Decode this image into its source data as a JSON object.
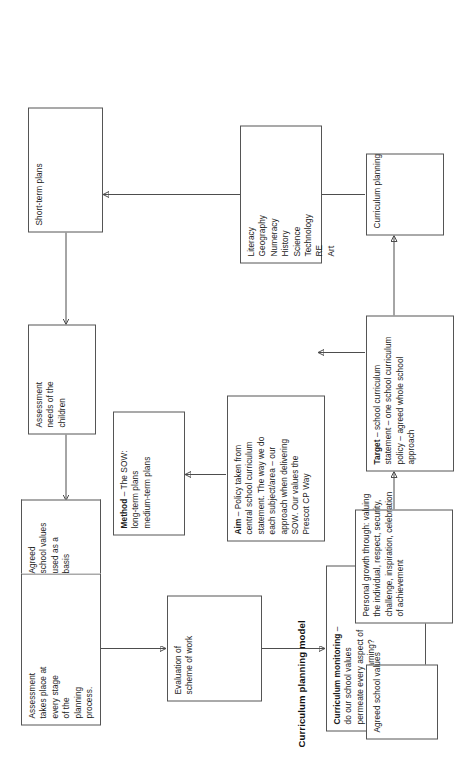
{
  "diagram": {
    "title": "Curriculum planning model",
    "type": "flowchart",
    "orientation": "rotated-90-ccw",
    "colors": {
      "background": "#ffffff",
      "box_border": "#555555",
      "text": "#1a1a1a",
      "connector": "#4d4d4d"
    },
    "nodes": [
      {
        "id": "assessment-stage",
        "lines": [
          "Assessment",
          "takes place at",
          "every stage",
          "of the",
          "planning",
          "process.",
          "Agreed",
          "school values",
          "used as a",
          "basis"
        ]
      },
      {
        "id": "assessment-needs",
        "lines": [
          "Assessment",
          "needs of the",
          "children"
        ]
      },
      {
        "id": "short-term-plans",
        "lines": [
          "Short-term plans"
        ]
      },
      {
        "id": "evaluation-scheme",
        "lines": [
          "Evaluation of",
          "scheme of work"
        ]
      },
      {
        "id": "method-sow",
        "lines": [
          "Method – The SOW:",
          "long-term plans",
          "medium-term plans"
        ],
        "bold_lead": "Method"
      },
      {
        "id": "curriculum-monitoring",
        "lines": [
          "Curriculum monitoring –",
          "do our school values",
          "permeate every aspect of",
          "teaching and learning?"
        ],
        "bold_lead": "Curriculum monitoring"
      },
      {
        "id": "aim-policy",
        "lines": [
          "Aim – Policy taken from",
          "central school curriculum",
          "statement. The way we do",
          "each subject/area – our",
          "approach when delivering",
          "SOW. Our values the",
          "Prescot CP Way"
        ],
        "bold_lead": "Aim"
      },
      {
        "id": "subjects-list",
        "lines": [
          "Literacy",
          "Geography",
          "Numeracy",
          "History",
          "Science",
          "Technology",
          "RE",
          "Art"
        ]
      },
      {
        "id": "agreed-school-values",
        "lines": [
          "Agreed school values"
        ]
      },
      {
        "id": "personal-growth",
        "lines": [
          "Personal growth through: valuing",
          "the individual, respect, security,",
          "challenge, inspiration, celebration",
          "of achievement"
        ]
      },
      {
        "id": "target-statement",
        "lines": [
          "Target – school curriculum",
          "statement – one school curriculum",
          "policy – agreed whole school",
          "approach"
        ],
        "bold_lead": "Target"
      },
      {
        "id": "curriculum-planning",
        "lines": [
          "Curriculum planning"
        ]
      }
    ],
    "edges": [
      {
        "from": "agreed-school-values",
        "to": "personal-growth"
      },
      {
        "from": "personal-growth",
        "to": "target-statement"
      },
      {
        "from": "target-statement",
        "to": "curriculum-planning"
      },
      {
        "from": "target-statement",
        "to": "aim-policy"
      },
      {
        "from": "curriculum-planning",
        "to": "subjects-list"
      },
      {
        "from": "subjects-list",
        "to": "short-term-plans"
      },
      {
        "from": "aim-policy",
        "to": "method-sow"
      },
      {
        "from": "short-term-plans",
        "to": "assessment-needs"
      },
      {
        "from": "assessment-needs",
        "to": "assessment-stage"
      },
      {
        "from": "assessment-stage",
        "to": "evaluation-scheme"
      },
      {
        "from": "evaluation-scheme",
        "to": "curriculum-monitoring"
      }
    ]
  }
}
